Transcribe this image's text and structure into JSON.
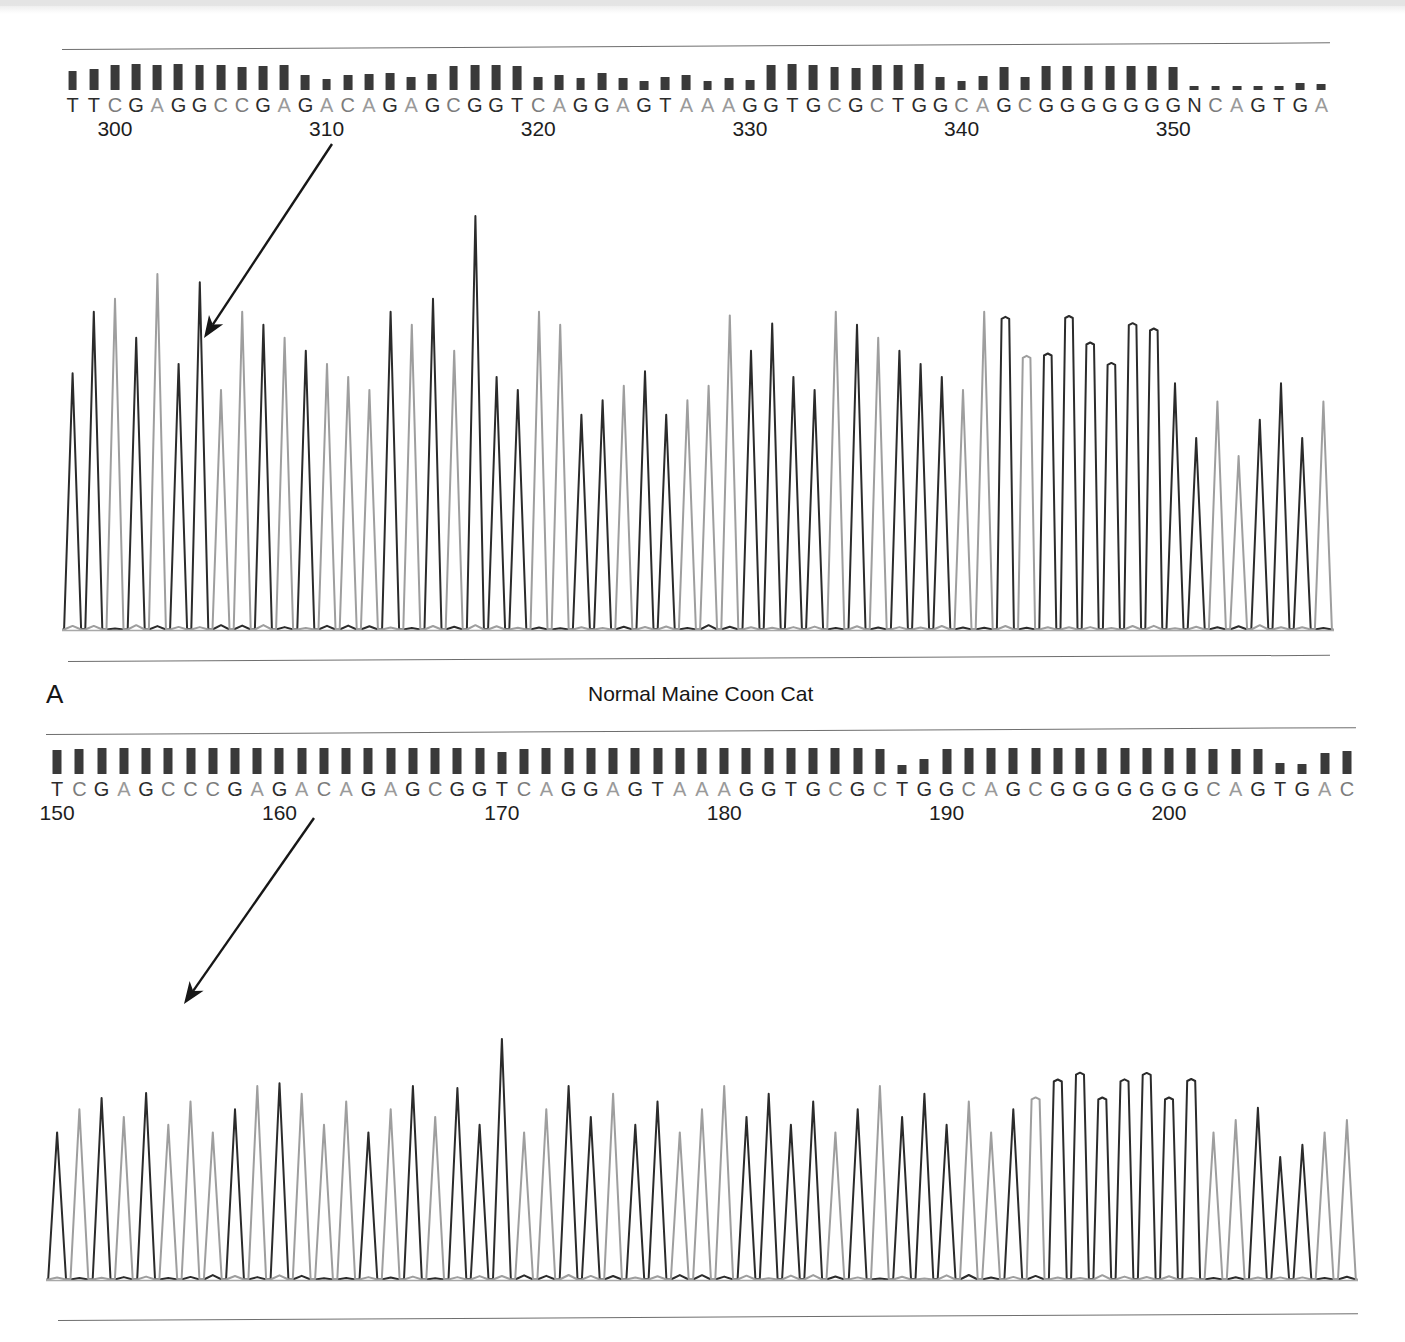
{
  "figure": {
    "type": "sanger-chromatogram-figure",
    "panel_letter": "A",
    "caption": "Normal Maine Coon Cat",
    "colors": {
      "base_A": "#9a9a9a",
      "base_C": "#7c7c7c",
      "base_G": "#2c2c2c",
      "base_T": "#2c2c2c",
      "trace_dark": "#2b2b2b",
      "trace_light": "#9e9e9e",
      "rule_line": "#6e6e6e",
      "background": "#ffffff"
    }
  },
  "chart_data": {
    "type": "line",
    "title": "Normal Maine Coon Cat",
    "xlabel": "Base position",
    "ylabel": "Fluorescence intensity",
    "grid": false,
    "legend": "none",
    "panels": [
      {
        "name": "top-electropherogram",
        "start_position": 298,
        "sequence": "TTCGAGGCCGAGACAGAGCGGTCAGGAGTAAAGGTGCGCTGGCAGCGGGGGGNCAGTGA",
        "tick_labels": [
          "300",
          "310",
          "320",
          "330",
          "340",
          "350"
        ],
        "tick_positions": [
          300,
          310,
          320,
          330,
          340,
          350
        ],
        "bases": [
          {
            "i": 298,
            "base": "T",
            "quality": 38
          },
          {
            "i": 299,
            "base": "T",
            "quality": 42
          },
          {
            "i": 300,
            "base": "C",
            "quality": 50
          },
          {
            "i": 301,
            "base": "G",
            "quality": 52
          },
          {
            "i": 302,
            "base": "A",
            "quality": 50
          },
          {
            "i": 303,
            "base": "G",
            "quality": 52
          },
          {
            "i": 304,
            "base": "G",
            "quality": 50
          },
          {
            "i": 305,
            "base": "C",
            "quality": 50
          },
          {
            "i": 306,
            "base": "C",
            "quality": 46
          },
          {
            "i": 307,
            "base": "G",
            "quality": 48
          },
          {
            "i": 308,
            "base": "A",
            "quality": 50
          },
          {
            "i": 309,
            "base": "G",
            "quality": 30
          },
          {
            "i": 310,
            "base": "A",
            "quality": 22
          },
          {
            "i": 311,
            "base": "C",
            "quality": 30
          },
          {
            "i": 312,
            "base": "A",
            "quality": 32
          },
          {
            "i": 313,
            "base": "G",
            "quality": 34
          },
          {
            "i": 314,
            "base": "A",
            "quality": 26
          },
          {
            "i": 315,
            "base": "G",
            "quality": 32
          },
          {
            "i": 316,
            "base": "C",
            "quality": 48
          },
          {
            "i": 317,
            "base": "G",
            "quality": 50
          },
          {
            "i": 318,
            "base": "G",
            "quality": 50
          },
          {
            "i": 319,
            "base": "T",
            "quality": 48
          },
          {
            "i": 320,
            "base": "C",
            "quality": 26
          },
          {
            "i": 321,
            "base": "A",
            "quality": 30
          },
          {
            "i": 322,
            "base": "G",
            "quality": 24
          },
          {
            "i": 323,
            "base": "G",
            "quality": 34
          },
          {
            "i": 324,
            "base": "A",
            "quality": 24
          },
          {
            "i": 325,
            "base": "G",
            "quality": 18
          },
          {
            "i": 326,
            "base": "T",
            "quality": 26
          },
          {
            "i": 327,
            "base": "A",
            "quality": 30
          },
          {
            "i": 328,
            "base": "A",
            "quality": 18
          },
          {
            "i": 329,
            "base": "A",
            "quality": 24
          },
          {
            "i": 330,
            "base": "G",
            "quality": 20
          },
          {
            "i": 331,
            "base": "G",
            "quality": 50
          },
          {
            "i": 332,
            "base": "T",
            "quality": 52
          },
          {
            "i": 333,
            "base": "G",
            "quality": 50
          },
          {
            "i": 334,
            "base": "C",
            "quality": 46
          },
          {
            "i": 335,
            "base": "G",
            "quality": 44
          },
          {
            "i": 336,
            "base": "C",
            "quality": 50
          },
          {
            "i": 337,
            "base": "T",
            "quality": 50
          },
          {
            "i": 338,
            "base": "G",
            "quality": 52
          },
          {
            "i": 339,
            "base": "G",
            "quality": 26
          },
          {
            "i": 340,
            "base": "C",
            "quality": 18
          },
          {
            "i": 341,
            "base": "A",
            "quality": 28
          },
          {
            "i": 342,
            "base": "G",
            "quality": 46
          },
          {
            "i": 343,
            "base": "C",
            "quality": 26
          },
          {
            "i": 344,
            "base": "G",
            "quality": 48
          },
          {
            "i": 345,
            "base": "G",
            "quality": 48
          },
          {
            "i": 346,
            "base": "G",
            "quality": 48
          },
          {
            "i": 347,
            "base": "G",
            "quality": 48
          },
          {
            "i": 348,
            "base": "G",
            "quality": 48
          },
          {
            "i": 349,
            "base": "G",
            "quality": 48
          },
          {
            "i": 350,
            "base": "G",
            "quality": 46
          },
          {
            "i": 351,
            "base": "N",
            "quality": 8
          },
          {
            "i": 352,
            "base": "C",
            "quality": 8
          },
          {
            "i": 353,
            "base": "A",
            "quality": 8
          },
          {
            "i": 354,
            "base": "G",
            "quality": 8
          },
          {
            "i": 355,
            "base": "T",
            "quality": 8
          },
          {
            "i": 356,
            "base": "G",
            "quality": 14
          },
          {
            "i": 357,
            "base": "A",
            "quality": 12
          }
        ]
      },
      {
        "name": "bottom-electropherogram",
        "start_position": 150,
        "sequence": "TCGAGCCCGAGACAGAGCGGTCAGGAGTAAAGGTGCGCTGGCAGCGGGGGGGCAGTGAC",
        "tick_labels": [
          "150",
          "160",
          "170",
          "180",
          "190",
          "200"
        ],
        "tick_positions": [
          150,
          160,
          170,
          180,
          190,
          200
        ],
        "bases": [
          {
            "i": 150,
            "base": "T",
            "quality": 48
          },
          {
            "i": 151,
            "base": "C",
            "quality": 50
          },
          {
            "i": 152,
            "base": "G",
            "quality": 52
          },
          {
            "i": 153,
            "base": "A",
            "quality": 52
          },
          {
            "i": 154,
            "base": "G",
            "quality": 52
          },
          {
            "i": 155,
            "base": "C",
            "quality": 52
          },
          {
            "i": 156,
            "base": "C",
            "quality": 52
          },
          {
            "i": 157,
            "base": "C",
            "quality": 52
          },
          {
            "i": 158,
            "base": "G",
            "quality": 52
          },
          {
            "i": 159,
            "base": "A",
            "quality": 52
          },
          {
            "i": 160,
            "base": "G",
            "quality": 52
          },
          {
            "i": 161,
            "base": "A",
            "quality": 52
          },
          {
            "i": 162,
            "base": "C",
            "quality": 52
          },
          {
            "i": 163,
            "base": "A",
            "quality": 52
          },
          {
            "i": 164,
            "base": "G",
            "quality": 52
          },
          {
            "i": 165,
            "base": "A",
            "quality": 52
          },
          {
            "i": 166,
            "base": "G",
            "quality": 52
          },
          {
            "i": 167,
            "base": "C",
            "quality": 52
          },
          {
            "i": 168,
            "base": "G",
            "quality": 52
          },
          {
            "i": 169,
            "base": "G",
            "quality": 52
          },
          {
            "i": 170,
            "base": "T",
            "quality": 44
          },
          {
            "i": 171,
            "base": "C",
            "quality": 50
          },
          {
            "i": 172,
            "base": "A",
            "quality": 52
          },
          {
            "i": 173,
            "base": "G",
            "quality": 52
          },
          {
            "i": 174,
            "base": "G",
            "quality": 52
          },
          {
            "i": 175,
            "base": "A",
            "quality": 52
          },
          {
            "i": 176,
            "base": "G",
            "quality": 52
          },
          {
            "i": 177,
            "base": "T",
            "quality": 52
          },
          {
            "i": 178,
            "base": "A",
            "quality": 52
          },
          {
            "i": 179,
            "base": "A",
            "quality": 52
          },
          {
            "i": 180,
            "base": "A",
            "quality": 52
          },
          {
            "i": 181,
            "base": "G",
            "quality": 52
          },
          {
            "i": 182,
            "base": "G",
            "quality": 52
          },
          {
            "i": 183,
            "base": "T",
            "quality": 52
          },
          {
            "i": 184,
            "base": "G",
            "quality": 52
          },
          {
            "i": 185,
            "base": "C",
            "quality": 52
          },
          {
            "i": 186,
            "base": "G",
            "quality": 52
          },
          {
            "i": 187,
            "base": "C",
            "quality": 50
          },
          {
            "i": 188,
            "base": "T",
            "quality": 18
          },
          {
            "i": 189,
            "base": "G",
            "quality": 30
          },
          {
            "i": 190,
            "base": "G",
            "quality": 50
          },
          {
            "i": 191,
            "base": "C",
            "quality": 52
          },
          {
            "i": 192,
            "base": "A",
            "quality": 52
          },
          {
            "i": 193,
            "base": "G",
            "quality": 52
          },
          {
            "i": 194,
            "base": "C",
            "quality": 52
          },
          {
            "i": 195,
            "base": "G",
            "quality": 52
          },
          {
            "i": 196,
            "base": "G",
            "quality": 52
          },
          {
            "i": 197,
            "base": "G",
            "quality": 52
          },
          {
            "i": 198,
            "base": "G",
            "quality": 52
          },
          {
            "i": 199,
            "base": "G",
            "quality": 52
          },
          {
            "i": 200,
            "base": "G",
            "quality": 52
          },
          {
            "i": 201,
            "base": "G",
            "quality": 52
          },
          {
            "i": 202,
            "base": "C",
            "quality": 50
          },
          {
            "i": 203,
            "base": "A",
            "quality": 50
          },
          {
            "i": 204,
            "base": "G",
            "quality": 50
          },
          {
            "i": 205,
            "base": "T",
            "quality": 22
          },
          {
            "i": 206,
            "base": "G",
            "quality": 20
          },
          {
            "i": 207,
            "base": "A",
            "quality": 42
          },
          {
            "i": 208,
            "base": "C",
            "quality": 46
          }
        ]
      }
    ]
  },
  "annotations": {
    "top_arrow": {
      "name": "top-pointer-arrow",
      "from_x": 332,
      "from_y": 144,
      "to_x": 204,
      "to_y": 338
    },
    "bottom_arrow": {
      "name": "bottom-pointer-arrow",
      "from_x": 314,
      "from_y": 818,
      "to_x": 184,
      "to_y": 1004
    }
  }
}
